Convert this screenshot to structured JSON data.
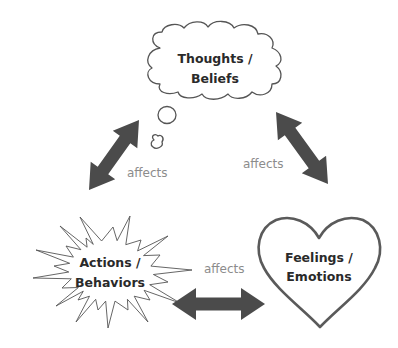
{
  "nodes": {
    "thoughts": {
      "line1": "Thoughts /",
      "line2": "Beliefs",
      "shape": "cloud"
    },
    "feelings": {
      "line1": "Feelings /",
      "line2": "Emotions",
      "shape": "heart"
    },
    "actions": {
      "line1": "Actions /",
      "line2": "Behaviors",
      "shape": "starburst"
    }
  },
  "edges": [
    {
      "from": "thoughts",
      "to": "actions",
      "label": "affects",
      "direction": "both"
    },
    {
      "from": "thoughts",
      "to": "feelings",
      "label": "affects",
      "direction": "both"
    },
    {
      "from": "actions",
      "to": "feelings",
      "label": "affects",
      "direction": "both"
    }
  ],
  "colors": {
    "arrow": "#4b4b4b",
    "outline": "#555555",
    "node_text": "#2a2a2a",
    "edge_text": "#8c8c8c"
  }
}
